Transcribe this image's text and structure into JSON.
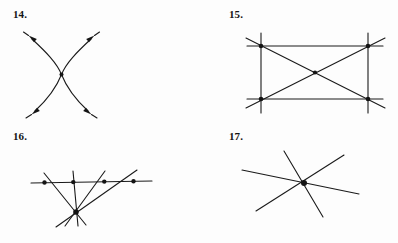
{
  "page": {
    "background_color": "#fdfdfd",
    "ink_color": "#1a1a1a",
    "kind": "geometry-exercise-figures",
    "columns": 2,
    "rows": 2
  },
  "figures": [
    {
      "label": "14.",
      "name": "figure-14",
      "caption_position": "top-left",
      "description": "Two smooth arcs crossing at a single interior point, each arc drawn with arrowheads at both ends pointing away from the crossing, forming an hourglass / X shape.",
      "element_count": 2,
      "intersection_points": 1,
      "has_arrowheads": true,
      "arrowhead_count": 4,
      "geometry": {
        "viewbox": "0 0 199 122",
        "cross_point": [
          61.5,
          74.5
        ],
        "curves": [
          {
            "name": "curve-left-to-right",
            "d": "M 32 39 C 46 52, 57 63, 61.5 74.5 C 66 86, 74 98, 88 111"
          },
          {
            "name": "curve-right-to-left",
            "d": "M 91 39 C 77 52, 66 63, 61.5 74.5 C 57 86, 49 98, 35 111"
          }
        ],
        "arrowheads": [
          {
            "name": "arrowhead-upper-left",
            "tip": [
              28.5,
              35.5
            ],
            "angle_deg": 222
          },
          {
            "name": "arrowhead-upper-right",
            "tip": [
              94.5,
              35.5
            ],
            "angle_deg": 318
          },
          {
            "name": "arrowhead-lower-left",
            "tip": [
              31.5,
              114.5
            ],
            "angle_deg": 138
          },
          {
            "name": "arrowhead-lower-right",
            "tip": [
              91.5,
              114.5
            ],
            "angle_deg": 42
          }
        ],
        "dots": [
          [
            61.5,
            74.5
          ]
        ]
      }
    },
    {
      "label": "15.",
      "name": "figure-15",
      "caption_position": "top-left",
      "description": "Six straight lines forming a rectangle with both diagonals; each line extends slightly beyond the four corner vertices. Dots mark the four corners and the centre where the diagonals cross.",
      "element_count": 6,
      "intersection_points": 5,
      "has_arrowheads": false,
      "arrowhead_count": 0,
      "geometry": {
        "viewbox": "0 0 199 122",
        "corners": {
          "top_left": [
            62,
            46
          ],
          "top_right": [
            169,
            46
          ],
          "bottom_left": [
            62,
            99
          ],
          "bottom_right": [
            169,
            99
          ]
        },
        "lines": [
          {
            "name": "line-top-horizontal",
            "x1": 48,
            "y1": 46,
            "x2": 184,
            "y2": 46
          },
          {
            "name": "line-bottom-horizontal",
            "x1": 48,
            "y1": 99,
            "x2": 184,
            "y2": 99
          },
          {
            "name": "line-left-vertical",
            "x1": 62,
            "y1": 33,
            "x2": 62,
            "y2": 113
          },
          {
            "name": "line-right-vertical",
            "x1": 169,
            "y1": 33,
            "x2": 169,
            "y2": 113
          },
          {
            "name": "diagonal-tl-br",
            "x1": 47,
            "y1": 38,
            "x2": 186,
            "y2": 108
          },
          {
            "name": "diagonal-bl-tr",
            "x1": 47,
            "y1": 108,
            "x2": 186,
            "y2": 38
          }
        ],
        "dots": [
          [
            62,
            46
          ],
          [
            169,
            46
          ],
          [
            62,
            99
          ],
          [
            169,
            99
          ],
          [
            116,
            72.5
          ]
        ]
      }
    },
    {
      "label": "16.",
      "name": "figure-16",
      "caption_position": "top-left",
      "description": "A pencil of four concurrent lines radiating from one point below, all cut by a single horizontal transversal above; dots mark the common point and each of the four intersections on the transversal.",
      "element_count": 5,
      "intersection_points": 5,
      "has_arrowheads": false,
      "arrowhead_count": 0,
      "geometry": {
        "viewbox": "0 0 199 121",
        "concurrency_point": [
          76,
          212
        ],
        "concurrency_point_local": [
          76,
          90
        ],
        "transversal": {
          "name": "line-transversal",
          "x1": 31,
          "y1": 61,
          "x2": 152,
          "y2": 59
        },
        "pencil_lines": [
          {
            "name": "pencil-line-1",
            "x1": 44,
            "y1": 51,
            "x2": 86,
            "y2": 103
          },
          {
            "name": "pencil-line-2",
            "x1": 73,
            "y1": 49,
            "x2": 78,
            "y2": 104
          },
          {
            "name": "pencil-line-3",
            "x1": 105,
            "y1": 49,
            "x2": 65,
            "y2": 104
          },
          {
            "name": "pencil-line-4",
            "x1": 137,
            "y1": 48,
            "x2": 56,
            "y2": 105
          }
        ],
        "dots": [
          [
            44.5,
            60.5
          ],
          [
            73.3,
            60.1
          ],
          [
            104.3,
            59.6
          ],
          [
            133.5,
            59.2
          ],
          [
            76,
            90
          ]
        ]
      }
    },
    {
      "label": "17.",
      "name": "figure-17",
      "caption_position": "top-left",
      "description": "Three straight lines all passing through one common point, forming a six-rayed asterisk with a single heavy dot at the concurrency point.",
      "element_count": 3,
      "intersection_points": 1,
      "has_arrowheads": false,
      "arrowhead_count": 0,
      "geometry": {
        "viewbox": "0 0 199 121",
        "concurrency_point": [
          105,
          61
        ],
        "lines": [
          {
            "name": "line-a",
            "x1": 85,
            "y1": 29,
            "x2": 124,
            "y2": 95
          },
          {
            "name": "line-b",
            "x1": 43,
            "y1": 48,
            "x2": 160,
            "y2": 72
          },
          {
            "name": "line-c",
            "x1": 145,
            "y1": 33,
            "x2": 57,
            "y2": 89
          }
        ],
        "dots": [
          [
            105,
            61
          ]
        ]
      }
    }
  ]
}
